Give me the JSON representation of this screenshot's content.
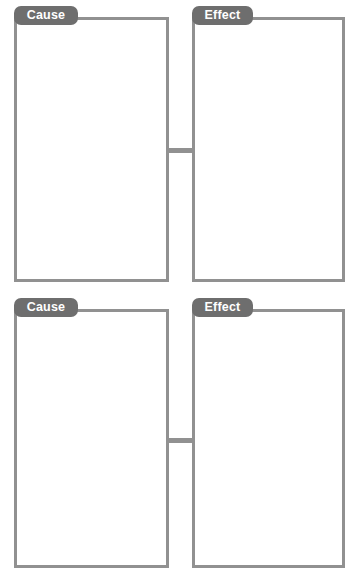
{
  "worksheet": {
    "title": "Cause and Effect Graphic Organizer",
    "background_color": "#ffffff",
    "tab_color": "#6e6e6e",
    "tab_text_color": "#ffffff",
    "border_color": "#919191",
    "connector_color": "#919191"
  },
  "rows": [
    {
      "index": 1,
      "cause": {
        "tab_label": "Cause",
        "body_text": ""
      },
      "effect": {
        "tab_label": "Effect",
        "body_text": ""
      },
      "connector": {
        "name": "cause-effect-connector"
      }
    },
    {
      "index": 2,
      "cause": {
        "tab_label": "Cause",
        "body_text": ""
      },
      "effect": {
        "tab_label": "Effect",
        "body_text": ""
      },
      "connector": {
        "name": "cause-effect-connector"
      }
    }
  ]
}
